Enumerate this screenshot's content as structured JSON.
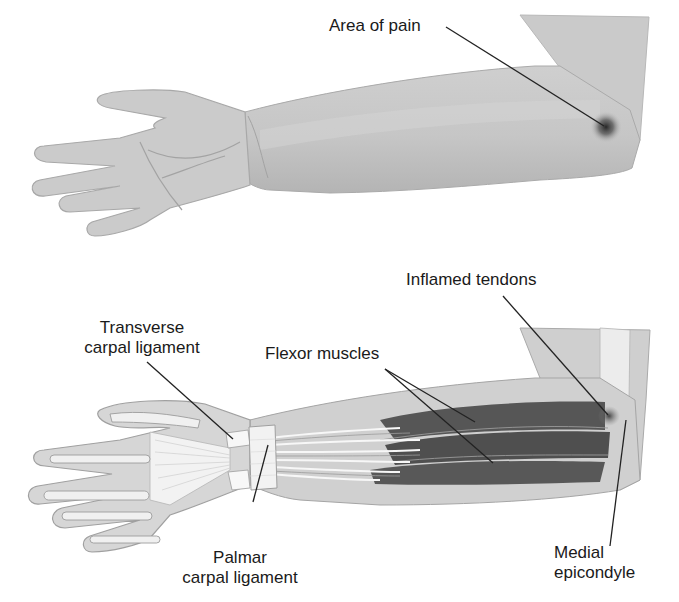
{
  "figure": {
    "panels": [
      {
        "id": "surface-view",
        "description": "Palm-up forearm and hand, external view",
        "labels": [
          {
            "key": "area_of_pain",
            "text": "Area of pain"
          }
        ]
      },
      {
        "id": "anatomical-view",
        "description": "Palm-up forearm cutaway showing ligaments, tendons and muscles",
        "labels": [
          {
            "key": "transverse_carpal_ligament",
            "text": "Transverse carpal ligament"
          },
          {
            "key": "flexor_muscles",
            "text": "Flexor muscles"
          },
          {
            "key": "inflamed_tendons",
            "text": "Inflamed tendons"
          },
          {
            "key": "palmar_carpal_ligament",
            "text": "Palmar carpal ligament"
          },
          {
            "key": "medial_epicondyle",
            "text": "Medial epicondyle"
          }
        ]
      }
    ]
  },
  "labels": {
    "area_of_pain": "Area of pain",
    "transverse_line1": "Transverse",
    "transverse_line2": "carpal ligament",
    "flexor_muscles": "Flexor muscles",
    "inflamed_tendons": "Inflamed tendons",
    "palmar_line1": "Palmar",
    "palmar_line2": "carpal ligament",
    "medial_line1": "Medial",
    "medial_line2": "epicondyle"
  },
  "colors": {
    "background": "#ffffff",
    "skin": "#c9c9c9",
    "skin_outline": "#a9a9a9",
    "muscle": "#555555",
    "ligament": "#f4f4f4",
    "pain_spot": "#2a2a2a",
    "leader_line": "#222222",
    "text": "#1a1a1a"
  }
}
